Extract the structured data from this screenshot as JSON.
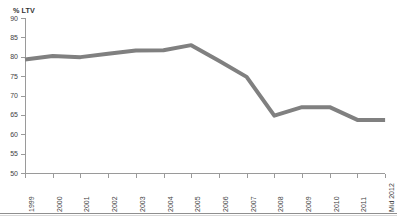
{
  "title_remnant": "",
  "axis": {
    "y_title": "% LTV",
    "y_ticks": [
      "90",
      "85",
      "80",
      "75",
      "70",
      "65",
      "60",
      "55",
      "50"
    ],
    "x_ticks": [
      "1999",
      "2000",
      "2001",
      "2002",
      "2003",
      "2004",
      "2005",
      "2006",
      "2007",
      "2008",
      "2009",
      "2010",
      "2011",
      "Mid 2012"
    ]
  },
  "style": {
    "line_color": "#808080",
    "axis_color": "#9a9a9a",
    "text_color": "#3f3f3f"
  },
  "chart_data": {
    "type": "line",
    "title": "",
    "xlabel": "",
    "ylabel": "% LTV",
    "ylim": [
      50,
      90
    ],
    "ytick_step": 5,
    "grid": false,
    "legend": false,
    "markers": false,
    "line_color": "#808080",
    "line_width_px": 4,
    "categories": [
      "1999",
      "2000",
      "2001",
      "2002",
      "2003",
      "2004",
      "2005",
      "2006",
      "2007",
      "2008",
      "2009",
      "2010",
      "2011",
      "Mid 2012"
    ],
    "values": [
      79.3,
      80.2,
      79.9,
      80.8,
      81.6,
      81.7,
      83.0,
      79.0,
      74.8,
      64.8,
      67.0,
      67.0,
      63.7,
      63.7
    ],
    "series": [
      {
        "name": "% LTV",
        "values": [
          79.3,
          80.2,
          79.9,
          80.8,
          81.6,
          81.7,
          83.0,
          79.0,
          74.8,
          64.8,
          67.0,
          67.0,
          63.7,
          63.7
        ]
      }
    ]
  }
}
